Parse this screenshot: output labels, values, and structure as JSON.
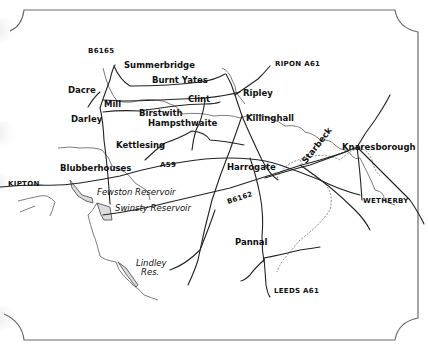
{
  "map": {
    "type": "hand-drawn road map",
    "colors": {
      "background": "#ffffff",
      "road": "#222222",
      "river": "#5a5a5a",
      "frame": "#6a6a6a",
      "reservoir_fill": "#dcdcdc"
    },
    "places": {
      "summerbridge": "Summerbridge",
      "burnt_yates": "Burnt Yates",
      "dacre": "Dacre",
      "mill": "Mill",
      "clint": "Clint",
      "darley": "Darley",
      "birstwith": "Birstwith",
      "hampsthwaite": "Hampsthwaite",
      "ripley": "Ripley",
      "killinghall": "Killinghall",
      "kettlesing": "Kettlesing",
      "blubberhouses": "Blubberhouses",
      "harrogate": "Harrogate",
      "knaresborough": "Knaresborough",
      "starbeck": "Starbeck",
      "wetherby": "WETHERBY",
      "pannal": "Pannal",
      "skipton": "KIPTON"
    },
    "roads": {
      "b6165": "B6165",
      "ripon_a61": "RIPON A61",
      "a59": "A59",
      "b6162": "B6162",
      "leeds_a61": "LEEDS A61"
    },
    "water": {
      "fewston": "Fewston Reservoir",
      "swinsty": "Swinsty Reservoir",
      "lindley_1": "Lindley",
      "lindley_2": "Res."
    }
  }
}
